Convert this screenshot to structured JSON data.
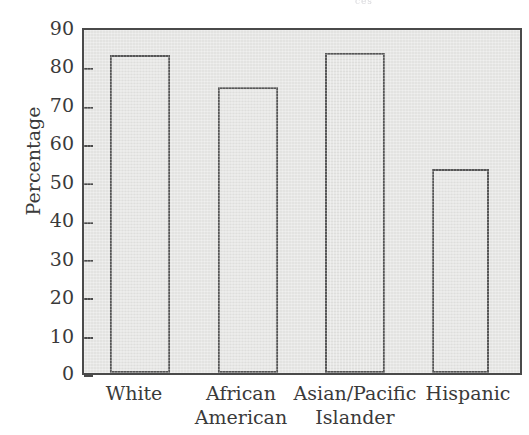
{
  "scan_remnant_text": "ces",
  "chart_data": {
    "type": "bar",
    "title": "",
    "xlabel": "",
    "ylabel": "Percentage",
    "ylim": [
      0,
      90
    ],
    "yticks": [
      0,
      10,
      20,
      30,
      40,
      50,
      60,
      70,
      80,
      90
    ],
    "ytick_labels": [
      "0",
      "10",
      "20",
      "30",
      "40",
      "50",
      "60",
      "70",
      "80",
      "90"
    ],
    "grid": false,
    "legend": "none",
    "categories": [
      "White",
      "African American",
      "Asian/Pacific Islander",
      "Hispanic"
    ],
    "category_lines": [
      [
        "White",
        ""
      ],
      [
        "African",
        "American"
      ],
      [
        "Asian/Pacific",
        "Islander"
      ],
      [
        "Hispanic",
        ""
      ]
    ],
    "values": [
      83.5,
      75.0,
      84.0,
      53.5
    ],
    "colors": {
      "bar_fill": "#dededc",
      "bar_border": "#565656",
      "plot_background": "#e3e3e1",
      "frame": "#4a4a4a",
      "text": "#3a3a3a"
    }
  }
}
